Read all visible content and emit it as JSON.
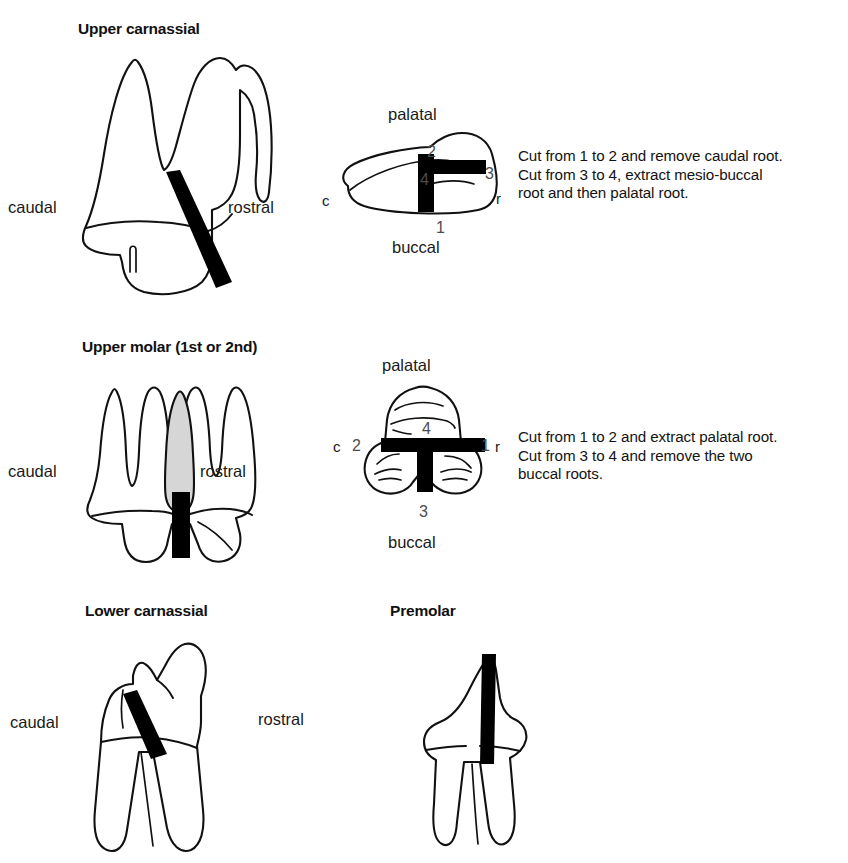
{
  "page": {
    "background_color": "#ffffff",
    "ink_color": "#111111",
    "cut_band_color": "#000000",
    "shaded_root_color": "#d6d6d6"
  },
  "sections": [
    {
      "id": "upper-carnassial",
      "heading": "Upper carnassial",
      "lateral_view": {
        "caudal_label": "caudal",
        "rostral_label": "rostral"
      },
      "occlusal_view": {
        "palatal_label": "palatal",
        "buccal_label": "buccal",
        "caudal_short": "c",
        "rostral_short": "r",
        "cut_points": [
          "1",
          "2",
          "3",
          "4"
        ]
      },
      "instructions": "Cut from 1 to 2 and remove caudal root.\nCut from 3 to 4, extract mesio-buccal\nroot and then palatal root."
    },
    {
      "id": "upper-molar",
      "heading": "Upper molar (1st or 2nd)",
      "lateral_view": {
        "caudal_label": "caudal",
        "rostral_label": "rostral"
      },
      "occlusal_view": {
        "palatal_label": "palatal",
        "buccal_label": "buccal",
        "caudal_short": "c",
        "rostral_short": "r",
        "cut_points": [
          "1",
          "2",
          "3",
          "4"
        ]
      },
      "instructions": "Cut from 1 to 2 and extract palatal root.\nCut from 3 to 4 and remove the two\nbuccal roots."
    },
    {
      "id": "lower-carnassial",
      "heading": "Lower carnassial",
      "lateral_view": {
        "caudal_label": "caudal",
        "rostral_label": "rostral"
      }
    },
    {
      "id": "premolar",
      "heading": "Premolar",
      "lateral_view": {
        "caudal_short": "c",
        "rostral_short": "r"
      }
    }
  ]
}
